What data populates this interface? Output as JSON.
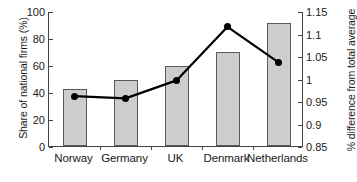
{
  "chart_data": {
    "type": "bar",
    "title": "",
    "xlabel": "",
    "ylabel": "Share of national firms (%)",
    "y2label": "% difference from total average",
    "categories": [
      "Norway",
      "Germany",
      "UK",
      "Denmark",
      "Netherlands"
    ],
    "ylim": [
      0,
      100
    ],
    "yticks": [
      0,
      20,
      40,
      60,
      80,
      100
    ],
    "ytick_labels": [
      "0",
      "20",
      "40",
      "60",
      "80",
      "100"
    ],
    "y2lim": [
      0.85,
      1.15
    ],
    "y2ticks": [
      0.85,
      0.9,
      0.95,
      1,
      1.05,
      1.1,
      1.15
    ],
    "y2tick_labels": [
      "0.85",
      "0.9",
      "0.95",
      "1",
      "1.05",
      "1.1",
      "1.15"
    ],
    "grid": false,
    "legend": "none",
    "series": [
      {
        "name": "Share of national firms (%)",
        "type": "bar",
        "axis": "left",
        "color": "#cdcdcd",
        "edge_color": "#5a5a5a",
        "values": [
          42,
          49,
          59,
          70,
          91
        ]
      },
      {
        "name": "% difference from total average",
        "type": "line",
        "axis": "right",
        "color": "#000000",
        "marker": "circle",
        "values": [
          0.963,
          0.958,
          0.998,
          1.117,
          1.038
        ]
      }
    ]
  },
  "axes": {
    "left_title": "Share of national firms (%)",
    "right_title": "% difference from total average"
  }
}
